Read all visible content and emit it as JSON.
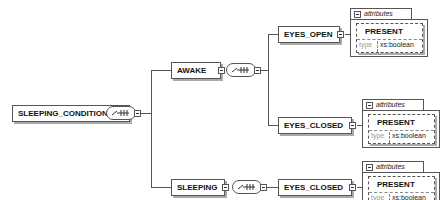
{
  "diagram": {
    "root": {
      "label": "SLEEPING_CONDITIONS",
      "compositor": "sequence"
    },
    "children": [
      {
        "label": "AWAKE",
        "compositor": "sequence",
        "children": [
          {
            "label": "EYES_OPEN",
            "attributes": {
              "header": "attributes",
              "name": "PRESENT",
              "type_label": "type",
              "type_value": "xs:boolean"
            }
          },
          {
            "label": "EYES_CLOSED",
            "attributes": {
              "header": "attributes",
              "name": "PRESENT",
              "type_label": "type",
              "type_value": "xs:boolean"
            }
          }
        ]
      },
      {
        "label": "SLEEPING",
        "compositor": "sequence",
        "children": [
          {
            "label": "EYES_CLOSED",
            "attributes": {
              "header": "attributes",
              "name": "PRESENT",
              "type_label": "type",
              "type_value": "xs:boolean"
            }
          }
        ]
      }
    ]
  }
}
